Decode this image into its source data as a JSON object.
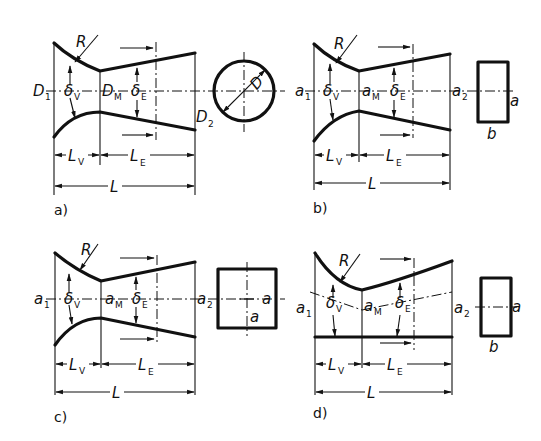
{
  "figure": {
    "panels": [
      {
        "id": "a",
        "caption": "a)",
        "inlet_label": "D",
        "inlet_sub": "1",
        "throat_label": "D",
        "throat_sub": "M",
        "outlet_label": "D",
        "outlet_sub": "2",
        "radius_label": "R",
        "angle_inlet": "δ",
        "angle_inlet_sub": "V",
        "angle_outlet": "δ",
        "angle_outlet_sub": "E",
        "length_inlet": "L",
        "length_inlet_sub": "V",
        "length_outlet": "L",
        "length_outlet_sub": "E",
        "length_total": "L",
        "section": "circle",
        "section_label": "D"
      },
      {
        "id": "b",
        "caption": "b)",
        "inlet_label": "a",
        "inlet_sub": "1",
        "throat_label": "a",
        "throat_sub": "M",
        "outlet_label": "a",
        "outlet_sub": "2",
        "radius_label": "R",
        "angle_inlet": "δ",
        "angle_inlet_sub": "V",
        "angle_outlet": "δ",
        "angle_outlet_sub": "E",
        "length_inlet": "L",
        "length_inlet_sub": "V",
        "length_outlet": "L",
        "length_outlet_sub": "E",
        "length_total": "L",
        "section": "rectangle",
        "section_label_side": "a",
        "section_label_bottom": "b"
      },
      {
        "id": "c",
        "caption": "c)",
        "inlet_label": "a",
        "inlet_sub": "1",
        "throat_label": "a",
        "throat_sub": "M",
        "outlet_label": "a",
        "outlet_sub": "2",
        "radius_label": "R",
        "angle_inlet": "δ",
        "angle_inlet_sub": "V",
        "angle_outlet": "δ",
        "angle_outlet_sub": "E",
        "length_inlet": "L",
        "length_inlet_sub": "V",
        "length_outlet": "L",
        "length_outlet_sub": "E",
        "length_total": "L",
        "section": "square",
        "section_label_side": "a",
        "section_label_inner": "a"
      },
      {
        "id": "d",
        "caption": "d)",
        "inlet_label": "a",
        "inlet_sub": "1",
        "throat_label": "a",
        "throat_sub": "M",
        "outlet_label": "a",
        "outlet_sub": "2",
        "radius_label": "R",
        "angle_inlet": "δ",
        "angle_inlet_sub": "V",
        "angle_outlet": "δ",
        "angle_outlet_sub": "E",
        "length_inlet": "L",
        "length_inlet_sub": "V",
        "length_outlet": "L",
        "length_outlet_sub": "E",
        "length_total": "L",
        "section": "rectangle",
        "section_label_side": "a",
        "section_label_bottom": "b"
      }
    ]
  }
}
